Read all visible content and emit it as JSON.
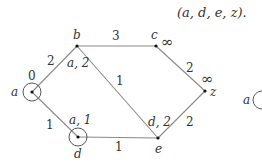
{
  "caption_fragment": "(a, d, e, z).",
  "nodes": [
    {
      "id": "a",
      "x": 32,
      "y": 92,
      "circled": true,
      "dist_label": "0",
      "name_label": "a"
    },
    {
      "id": "b",
      "x": 77,
      "y": 46,
      "circled": false,
      "dist_label": "a, 2",
      "name_label": "b"
    },
    {
      "id": "c",
      "x": 156,
      "y": 46,
      "circled": false,
      "dist_label": "∞",
      "name_label": "c"
    },
    {
      "id": "z",
      "x": 205,
      "y": 91,
      "circled": false,
      "dist_label": "∞",
      "name_label": "z"
    },
    {
      "id": "d",
      "x": 78,
      "y": 137,
      "circled": true,
      "dist_label": "a, 1",
      "name_label": "d"
    },
    {
      "id": "e",
      "x": 158,
      "y": 138,
      "circled": false,
      "dist_label": "d, 2",
      "name_label": "e"
    }
  ],
  "edges": [
    {
      "from": "a",
      "to": "b",
      "weight": "2"
    },
    {
      "from": "a",
      "to": "d",
      "weight": "1"
    },
    {
      "from": "b",
      "to": "c",
      "weight": "3"
    },
    {
      "from": "b",
      "to": "e",
      "weight": "1"
    },
    {
      "from": "c",
      "to": "z",
      "weight": "2"
    },
    {
      "from": "d",
      "to": "e",
      "weight": "1"
    },
    {
      "from": "e",
      "to": "z",
      "weight": "2"
    }
  ],
  "labels": {
    "a_name": "a",
    "a_dist": "0",
    "b_name": "b",
    "b_dist": "a, 2",
    "c_name": "c",
    "c_dist": "∞",
    "z_name": "z",
    "z_dist": "∞",
    "d_name": "d",
    "d_dist": "a, 1",
    "e_name": "e",
    "e_dist": "d, 2",
    "w_ab": "2",
    "w_ad": "1",
    "w_bc": "3",
    "w_be": "1",
    "w_cz": "2",
    "w_de": "1",
    "w_ez": "2",
    "next_diagram_a": "a"
  }
}
